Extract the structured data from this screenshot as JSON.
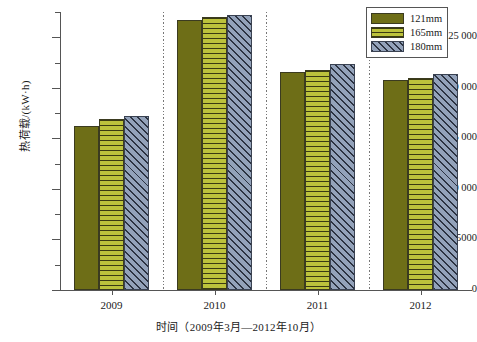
{
  "chart_data": {
    "type": "bar",
    "title": "",
    "xlabel": "时间（2009年3月—2012年10月）",
    "ylabel": "热荷载/(kW·h)",
    "categories": [
      "2009",
      "2010",
      "2011",
      "2012"
    ],
    "series": [
      {
        "name": "121mm",
        "color": "#6e6e17",
        "pattern": "solid",
        "values": [
          16200,
          26700,
          21600,
          20800
        ]
      },
      {
        "name": "165mm",
        "color": "#bcc23c",
        "pattern": "horizontal",
        "values": [
          16900,
          27000,
          21800,
          21000
        ]
      },
      {
        "name": "180mm",
        "color": "#93a2ba",
        "pattern": "diagonal",
        "values": [
          17200,
          27200,
          22400,
          21400
        ]
      }
    ],
    "ylim": [
      0,
      27500
    ],
    "yticks": [
      0,
      5000,
      10000,
      15000,
      20000,
      25000
    ],
    "ytick_labels": [
      "0",
      "5000",
      "10 000",
      "15 000",
      "20 000",
      "25 000"
    ],
    "yminor_ticks": [
      2500,
      7500,
      12500,
      17500,
      22500,
      27500
    ],
    "grid": false,
    "legend_position": "top-right",
    "group_separators": true
  },
  "legend": {
    "items": [
      {
        "label": "121mm"
      },
      {
        "label": "165mm"
      },
      {
        "label": "180mm"
      }
    ]
  }
}
